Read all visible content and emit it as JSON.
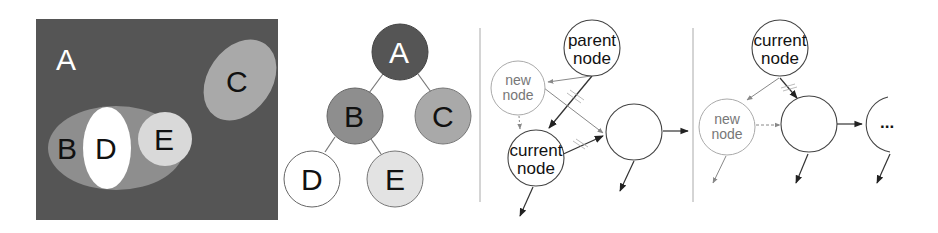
{
  "figure": {
    "panels": [
      {
        "id": "set-diagram",
        "labels": {
          "a": "A",
          "b": "B",
          "c": "C",
          "d": "D",
          "e": "E"
        },
        "colors": {
          "a": "#555555",
          "b": "#8e8e8e",
          "c": "#a9a9a9",
          "d": "#ffffff",
          "e": "#d9d9d9"
        }
      },
      {
        "id": "tree-diagram",
        "nodes": [
          {
            "label": "A",
            "color": "#555555",
            "text_color": "#ffffff"
          },
          {
            "label": "B",
            "color": "#8e8e8e",
            "text_color": "#111111"
          },
          {
            "label": "C",
            "color": "#a9a9a9",
            "text_color": "#111111"
          },
          {
            "label": "D",
            "color": "#ffffff",
            "text_color": "#111111"
          },
          {
            "label": "E",
            "color": "#d9d9d9",
            "text_color": "#111111"
          }
        ],
        "edges": [
          [
            "A",
            "B"
          ],
          [
            "A",
            "C"
          ],
          [
            "B",
            "D"
          ],
          [
            "B",
            "E"
          ]
        ]
      },
      {
        "id": "insert-between-parent-and-current",
        "nodes": {
          "parent": {
            "line1": "parent",
            "line2": "node"
          },
          "new": {
            "line1": "new",
            "line2": "node"
          },
          "current": {
            "line1": "current",
            "line2": "node"
          },
          "child": {
            "line1": "",
            "line2": ""
          }
        }
      },
      {
        "id": "insert-between-current-and-child",
        "nodes": {
          "current": {
            "line1": "current",
            "line2": "node"
          },
          "new": {
            "line1": "new",
            "line2": "node"
          },
          "child": {
            "line1": "",
            "line2": ""
          },
          "continuation": {
            "text": "..."
          }
        }
      }
    ],
    "colors": {
      "stroke": "#333333",
      "light_stroke": "#999999",
      "divider": "#aaaaaa"
    }
  }
}
